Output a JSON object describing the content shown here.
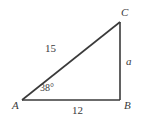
{
  "figure": {
    "type": "right-triangle-diagram",
    "background_color": "#ffffff",
    "stroke_color": "#3a3a3a",
    "text_color": "#3a3a3a",
    "vertices": [
      {
        "name": "A",
        "label": "A",
        "x": 22,
        "y": 100,
        "position": "bottom-left"
      },
      {
        "name": "B",
        "label": "B",
        "x": 120,
        "y": 100,
        "position": "bottom-right"
      },
      {
        "name": "C",
        "label": "C",
        "x": 120,
        "y": 22,
        "position": "top-right"
      }
    ],
    "sides": [
      {
        "name": "hypotenuse-AC",
        "label": "15",
        "between": "A-C"
      },
      {
        "name": "vertical-BC",
        "label": "a",
        "between": "B-C",
        "italic": true
      },
      {
        "name": "base-AB",
        "label": "12",
        "between": "A-B"
      }
    ],
    "angles": [
      {
        "name": "angle-at-A",
        "label": "38°",
        "at_vertex": "A"
      }
    ]
  }
}
